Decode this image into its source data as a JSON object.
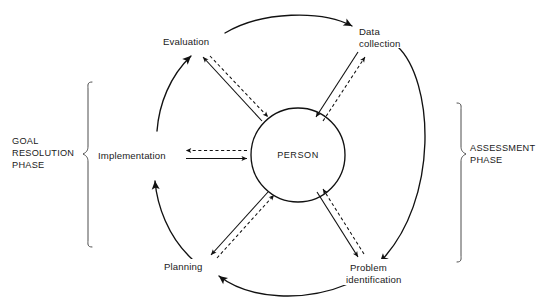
{
  "diagram": {
    "center_node": {
      "label": "PERSON",
      "shape": "circle"
    },
    "cycle_nodes": [
      {
        "id": "evaluation",
        "label": "Evaluation",
        "label_lines": [
          "Evaluation"
        ],
        "position": "upper-left"
      },
      {
        "id": "data-collection",
        "label": "Data collection",
        "label_lines": [
          "Data",
          "collection"
        ],
        "position": "upper-right"
      },
      {
        "id": "problem-identification",
        "label": "Problem identification",
        "label_lines": [
          "Problem",
          "identification"
        ],
        "position": "lower-right"
      },
      {
        "id": "planning",
        "label": "Planning",
        "label_lines": [
          "Planning"
        ],
        "position": "lower-left"
      },
      {
        "id": "implementation",
        "label": "Implementation",
        "label_lines": [
          "Implementation"
        ],
        "position": "left"
      }
    ],
    "phases": [
      {
        "id": "goal-resolution-phase",
        "label": "GOAL RESOLUTION PHASE",
        "label_lines": [
          "GOAL",
          "RESOLUTION",
          "PHASE"
        ],
        "side": "left"
      },
      {
        "id": "assessment-phase",
        "label": "ASSESSMENT PHASE",
        "label_lines": [
          "ASSESSMENT",
          "PHASE"
        ],
        "side": "right"
      }
    ],
    "outer_cycle_direction": "clockwise",
    "spoke_arrows": "bidirectional solid-and-dashed",
    "colors": {
      "stroke": "#111111",
      "bracket": "#4d4d4d",
      "background": "#ffffff",
      "text": "#1a1a1a"
    }
  }
}
